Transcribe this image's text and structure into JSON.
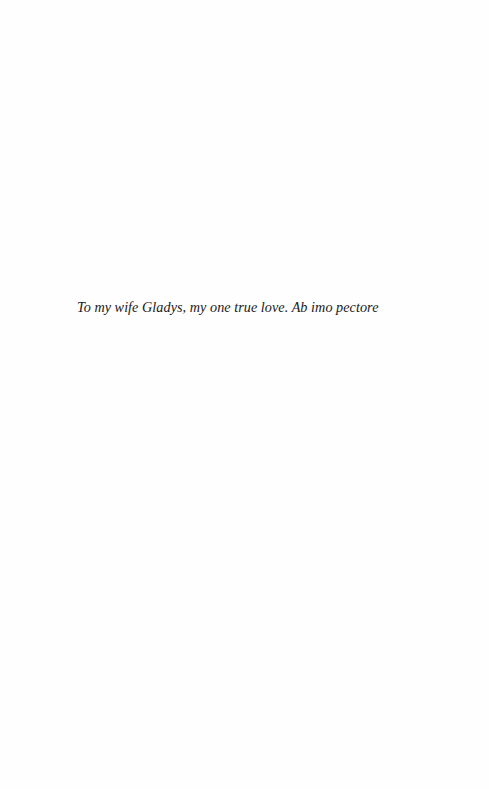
{
  "page": {
    "dedication": "To my wife Gladys, my one true love. Ab imo pectore"
  }
}
